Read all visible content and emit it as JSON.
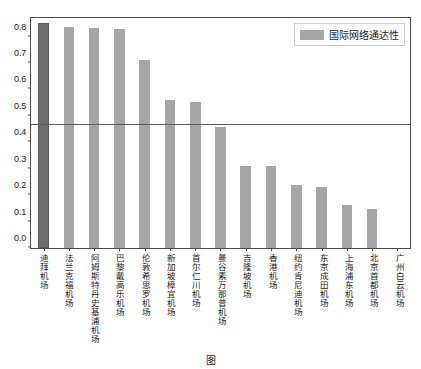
{
  "chart_data": {
    "type": "bar",
    "title": "",
    "subtitle": "",
    "xlabel": "",
    "ylabel": "",
    "ylim": [
      0.0,
      0.87
    ],
    "yticks": [
      "0.0",
      "0.1",
      "0.2",
      "0.3",
      "0.4",
      "0.5",
      "0.6",
      "0.7",
      "0.8"
    ],
    "ytick_values": [
      0.0,
      0.1,
      0.2,
      0.3,
      0.4,
      0.5,
      0.6,
      0.7,
      0.8
    ],
    "grid": false,
    "legend_position": "upper-right",
    "legend": [
      "国际网络通达性"
    ],
    "categories": [
      "迪拜机场",
      "法兰克福机场",
      "阿姆斯特丹史基浦机场",
      "巴黎戴高乐机场",
      "伦敦希思罗机场",
      "新加坡樟宜机场",
      "首尔仁川机场",
      "曼谷素万那普机场",
      "吉隆坡机场",
      "香港机场",
      "纽约肯尼迪机场",
      "东京成田机场",
      "上海浦东机场",
      "北京首都机场",
      "广州白云机场"
    ],
    "series": [
      {
        "name": "国际网络通达性",
        "values": [
          0.85,
          0.835,
          0.832,
          0.83,
          0.71,
          0.56,
          0.552,
          0.456,
          0.312,
          0.309,
          0.238,
          0.229,
          0.161,
          0.149,
          0.0
        ]
      }
    ],
    "highlight_index": 0,
    "reference_line": {
      "value": 0.467,
      "label": ""
    },
    "colors": {
      "bar": "#a6a6a6",
      "bar_highlight": "#6e6e6e",
      "reference_line": "#5a5a5a",
      "axis": "#4a4a4a",
      "text": "#1a1a1a"
    }
  },
  "caption": {
    "text": "图"
  }
}
